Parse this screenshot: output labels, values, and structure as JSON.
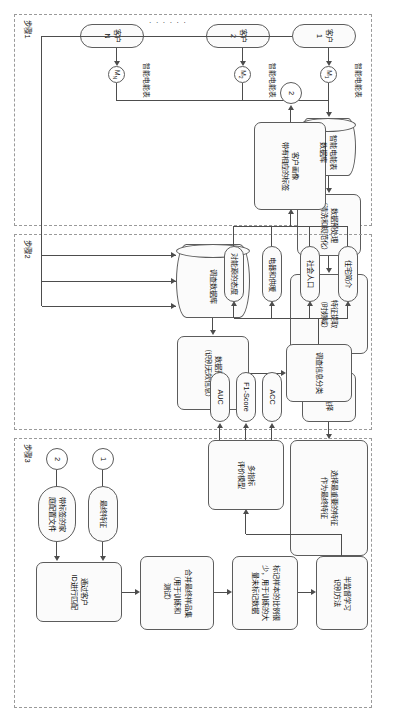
{
  "figure": {
    "orientation": "rotated-90",
    "panels": [
      {
        "id": "step1",
        "label": "步骤1"
      },
      {
        "id": "step2",
        "label": "步骤2"
      },
      {
        "id": "step3",
        "label": "步骤3"
      }
    ]
  },
  "step1": {
    "customers": [
      {
        "label": "客户1",
        "meter_id": "M",
        "meter_sub": "1",
        "meter_caption": "智能电能表"
      },
      {
        "label": "客户2",
        "meter_id": "M",
        "meter_sub": "2",
        "meter_caption": "智能电能表"
      },
      {
        "label": "客户N",
        "meter_id": "M",
        "meter_sub": "N",
        "meter_caption": "智能电能表"
      }
    ],
    "ellipsis": "· · · · · ·",
    "database": "智能电能表\n数据库",
    "preprocess": "数据预处理\n（清洗和规范化）",
    "extraction": "特征提取\n（时频域）",
    "selection": "特征选择",
    "final_feature": "选择最重要的特征\n作为最终特征",
    "connector_out": "1"
  },
  "step2": {
    "database": "调查数据库",
    "preprocess": "数据预处理\n（识别无效信息）",
    "classify": "调查信息分类",
    "categories": [
      {
        "label": "住宅简介"
      },
      {
        "label": "社会人口"
      },
      {
        "label": "电器和供暖"
      },
      {
        "label": "对能源的态度"
      }
    ],
    "profile": "客户画像\n带有相应的标签",
    "connector_out": "2"
  },
  "step3": {
    "connector_in_1": "1",
    "connector_in_2": "2",
    "input_feature": "最终特征",
    "input_profile": "带标签的家\n庭配置文件",
    "match": "通过客户\nID进行匹配",
    "merge": "合并最终样品集\n（用于训练和\n测试）",
    "ssl": "半监督学习\n识别方法",
    "label_ratio": "标记样本的比例很\n少，用于训练的大\n量未标记数据",
    "evaluation": "多指标\n评价模型",
    "metrics": [
      {
        "label": "ACC"
      },
      {
        "label": "F1-Score"
      },
      {
        "label": "AUC"
      }
    ]
  },
  "colors": {
    "node_border": "#5c5c5c",
    "node_fill": "#fbfbfb",
    "panel_border": "#9a9a9a",
    "line": "#4d4d4d",
    "text": "#111111"
  }
}
